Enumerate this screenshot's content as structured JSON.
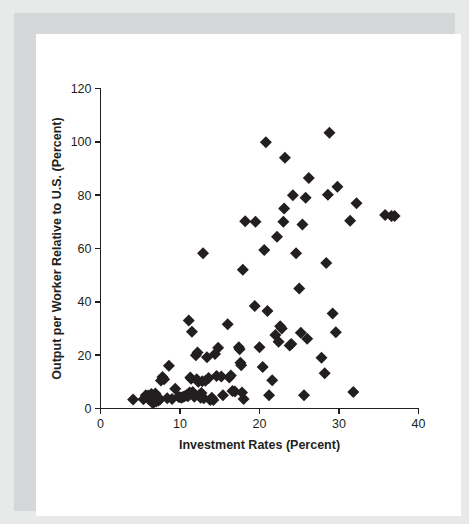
{
  "figure": {
    "background_color": "#ffffff",
    "frame_color": "#e8e9e9",
    "inner_frame_color": "#d6d7d8",
    "marker_color": "#231f20",
    "axis_color": "#231f20"
  },
  "chart_data": {
    "type": "scatter",
    "title": "",
    "subtitle": "",
    "xlabel": "Investment Rates (Percent)",
    "ylabel": "Output per Worker Relative to U.S. (Percent)",
    "xlim": [
      0,
      40
    ],
    "ylim": [
      0,
      120
    ],
    "xticks": [
      0,
      10,
      20,
      30,
      40
    ],
    "yticks": [
      0,
      20,
      40,
      60,
      80,
      100,
      120
    ],
    "xticklabels": [
      "0",
      "10",
      "20",
      "30",
      "40"
    ],
    "yticklabels": [
      "0",
      "20",
      "40",
      "60",
      "80",
      "100",
      "120"
    ],
    "grid": false,
    "legend": null,
    "legend_position": "none",
    "marker": "diamond",
    "marker_size": 6,
    "annotations": [],
    "points": [
      {
        "x": 4.1,
        "y": 3.4
      },
      {
        "x": 5.4,
        "y": 3.5
      },
      {
        "x": 5.7,
        "y": 5.0
      },
      {
        "x": 6.0,
        "y": 4.9
      },
      {
        "x": 6.1,
        "y": 3.4
      },
      {
        "x": 6.4,
        "y": 5.4
      },
      {
        "x": 6.6,
        "y": 2.0
      },
      {
        "x": 6.8,
        "y": 4.2
      },
      {
        "x": 6.9,
        "y": 5.6
      },
      {
        "x": 7.0,
        "y": 2.6
      },
      {
        "x": 7.2,
        "y": 3.8
      },
      {
        "x": 7.3,
        "y": 3.0
      },
      {
        "x": 7.5,
        "y": 3.5
      },
      {
        "x": 7.6,
        "y": 10.5
      },
      {
        "x": 7.8,
        "y": 11.8
      },
      {
        "x": 8.0,
        "y": 11.0
      },
      {
        "x": 8.4,
        "y": 3.8
      },
      {
        "x": 8.6,
        "y": 16.0
      },
      {
        "x": 9.0,
        "y": 3.6
      },
      {
        "x": 9.4,
        "y": 7.4
      },
      {
        "x": 9.8,
        "y": 4.4
      },
      {
        "x": 10.0,
        "y": 4.2
      },
      {
        "x": 10.2,
        "y": 4.0
      },
      {
        "x": 10.4,
        "y": 4.4
      },
      {
        "x": 10.6,
        "y": 4.6
      },
      {
        "x": 10.8,
        "y": 5.0
      },
      {
        "x": 11.0,
        "y": 4.6
      },
      {
        "x": 11.1,
        "y": 33.0
      },
      {
        "x": 11.2,
        "y": 6.0
      },
      {
        "x": 11.3,
        "y": 11.6
      },
      {
        "x": 11.4,
        "y": 11.2
      },
      {
        "x": 11.5,
        "y": 28.8
      },
      {
        "x": 11.6,
        "y": 6.2
      },
      {
        "x": 11.8,
        "y": 4.4
      },
      {
        "x": 12.0,
        "y": 20.0
      },
      {
        "x": 12.1,
        "y": 11.0
      },
      {
        "x": 12.2,
        "y": 21.0
      },
      {
        "x": 12.3,
        "y": 10.0
      },
      {
        "x": 12.4,
        "y": 5.0
      },
      {
        "x": 12.6,
        "y": 4.0
      },
      {
        "x": 12.7,
        "y": 5.8
      },
      {
        "x": 12.8,
        "y": 10.2
      },
      {
        "x": 12.9,
        "y": 58.2
      },
      {
        "x": 13.0,
        "y": 3.8
      },
      {
        "x": 13.2,
        "y": 10.4
      },
      {
        "x": 13.4,
        "y": 19.2
      },
      {
        "x": 13.6,
        "y": 11.4
      },
      {
        "x": 13.8,
        "y": 3.2
      },
      {
        "x": 14.0,
        "y": 4.0
      },
      {
        "x": 14.2,
        "y": 3.2
      },
      {
        "x": 14.4,
        "y": 20.4
      },
      {
        "x": 14.6,
        "y": 12.2
      },
      {
        "x": 14.8,
        "y": 22.8
      },
      {
        "x": 15.2,
        "y": 12.0
      },
      {
        "x": 15.4,
        "y": 5.0
      },
      {
        "x": 16.0,
        "y": 31.6
      },
      {
        "x": 16.2,
        "y": 11.6
      },
      {
        "x": 16.4,
        "y": 12.4
      },
      {
        "x": 16.6,
        "y": 6.6
      },
      {
        "x": 16.9,
        "y": 6.4
      },
      {
        "x": 17.4,
        "y": 23.0
      },
      {
        "x": 17.5,
        "y": 22.2
      },
      {
        "x": 17.6,
        "y": 17.2
      },
      {
        "x": 17.7,
        "y": 16.2
      },
      {
        "x": 17.8,
        "y": 6.0
      },
      {
        "x": 17.9,
        "y": 52.0
      },
      {
        "x": 18.0,
        "y": 3.6
      },
      {
        "x": 18.2,
        "y": 70.2
      },
      {
        "x": 19.4,
        "y": 38.4
      },
      {
        "x": 19.5,
        "y": 70.0
      },
      {
        "x": 20.0,
        "y": 23.0
      },
      {
        "x": 20.4,
        "y": 15.6
      },
      {
        "x": 20.6,
        "y": 59.4
      },
      {
        "x": 20.8,
        "y": 99.8
      },
      {
        "x": 21.0,
        "y": 36.6
      },
      {
        "x": 21.2,
        "y": 5.0
      },
      {
        "x": 21.6,
        "y": 10.6
      },
      {
        "x": 22.0,
        "y": 27.6
      },
      {
        "x": 22.2,
        "y": 64.4
      },
      {
        "x": 22.4,
        "y": 25.0
      },
      {
        "x": 22.6,
        "y": 30.8
      },
      {
        "x": 22.8,
        "y": 30.0
      },
      {
        "x": 23.0,
        "y": 70.0
      },
      {
        "x": 23.1,
        "y": 75.0
      },
      {
        "x": 23.2,
        "y": 94.0
      },
      {
        "x": 23.8,
        "y": 23.6
      },
      {
        "x": 24.0,
        "y": 24.2
      },
      {
        "x": 24.2,
        "y": 80.0
      },
      {
        "x": 24.6,
        "y": 58.2
      },
      {
        "x": 25.0,
        "y": 45.0
      },
      {
        "x": 25.2,
        "y": 28.4
      },
      {
        "x": 25.4,
        "y": 69.0
      },
      {
        "x": 25.6,
        "y": 5.0
      },
      {
        "x": 25.8,
        "y": 79.0
      },
      {
        "x": 26.0,
        "y": 26.2
      },
      {
        "x": 26.2,
        "y": 86.4
      },
      {
        "x": 27.8,
        "y": 19.0
      },
      {
        "x": 28.2,
        "y": 13.2
      },
      {
        "x": 28.4,
        "y": 54.6
      },
      {
        "x": 28.6,
        "y": 80.2
      },
      {
        "x": 28.8,
        "y": 103.4
      },
      {
        "x": 29.2,
        "y": 35.6
      },
      {
        "x": 29.6,
        "y": 28.6
      },
      {
        "x": 29.8,
        "y": 83.2
      },
      {
        "x": 31.4,
        "y": 70.4
      },
      {
        "x": 31.8,
        "y": 6.2
      },
      {
        "x": 32.2,
        "y": 77.0
      },
      {
        "x": 35.8,
        "y": 72.6
      },
      {
        "x": 36.6,
        "y": 72.2
      },
      {
        "x": 37.0,
        "y": 72.2
      }
    ]
  }
}
